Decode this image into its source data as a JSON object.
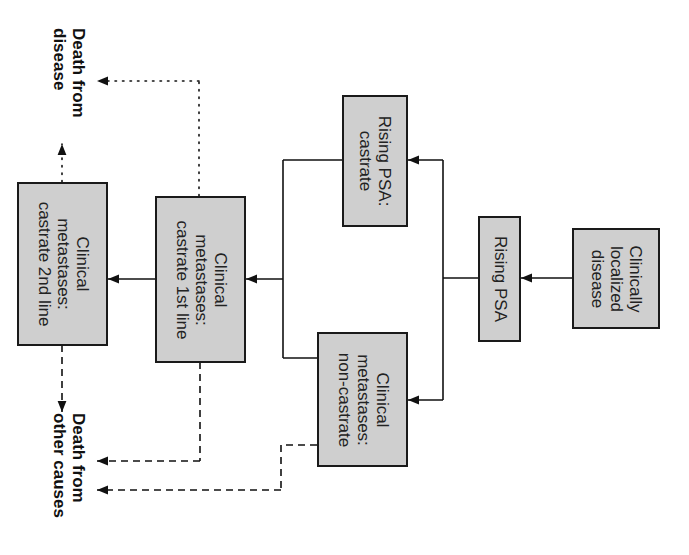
{
  "diagram": {
    "orientation": "rotated-90-clockwise",
    "colors": {
      "box_fill": "#cfcfcf",
      "box_border": "#1a1a1a",
      "line": "#111111"
    },
    "nodes": {
      "localized": {
        "lines": [
          "Clinically",
          "localized",
          "disease"
        ]
      },
      "rising_psa": {
        "lines": [
          "Rising PSA"
        ]
      },
      "rising_psa_castrate": {
        "lines": [
          "Rising PSA:",
          "castrate"
        ]
      },
      "mets_noncastrate": {
        "lines": [
          "Clinical",
          "metastases:",
          "non-castrate"
        ]
      },
      "mets_castrate_1st": {
        "lines": [
          "Clinical",
          "metastases:",
          "castrate 1st line"
        ]
      },
      "mets_castrate_2nd": {
        "lines": [
          "Clinical",
          "metastases:",
          "castrate 2nd line"
        ]
      }
    },
    "terminals": {
      "death_disease": {
        "lines": [
          "Death from",
          "disease"
        ]
      },
      "death_other": {
        "lines": [
          "Death from",
          "other causes"
        ]
      }
    },
    "edges": [
      {
        "from": "localized",
        "to": "rising_psa",
        "style": "solid"
      },
      {
        "from": "rising_psa",
        "to": "rising_psa_castrate",
        "style": "solid"
      },
      {
        "from": "rising_psa",
        "to": "mets_noncastrate",
        "style": "solid"
      },
      {
        "from": "rising_psa_castrate",
        "to": "mets_castrate_1st",
        "style": "solid"
      },
      {
        "from": "mets_noncastrate",
        "to": "mets_castrate_1st",
        "style": "solid"
      },
      {
        "from": "mets_castrate_1st",
        "to": "mets_castrate_2nd",
        "style": "solid"
      },
      {
        "from": "mets_castrate_1st",
        "to": "death_disease",
        "style": "dotted"
      },
      {
        "from": "mets_castrate_2nd",
        "to": "death_disease",
        "style": "dotted"
      },
      {
        "from": "mets_castrate_1st",
        "to": "death_other",
        "style": "dashed"
      },
      {
        "from": "mets_noncastrate",
        "to": "death_other",
        "style": "dashed"
      },
      {
        "from": "mets_castrate_2nd",
        "to": "death_other",
        "style": "dashed"
      }
    ]
  }
}
